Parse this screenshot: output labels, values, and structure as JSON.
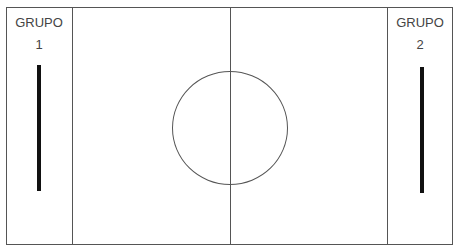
{
  "groups": [
    {
      "title": "GRUPO",
      "number": "1"
    },
    {
      "title": "GRUPO",
      "number": "2"
    }
  ],
  "colors": {
    "line": "#555555",
    "bar": "#111111",
    "text": "#444444",
    "background": "#ffffff"
  }
}
